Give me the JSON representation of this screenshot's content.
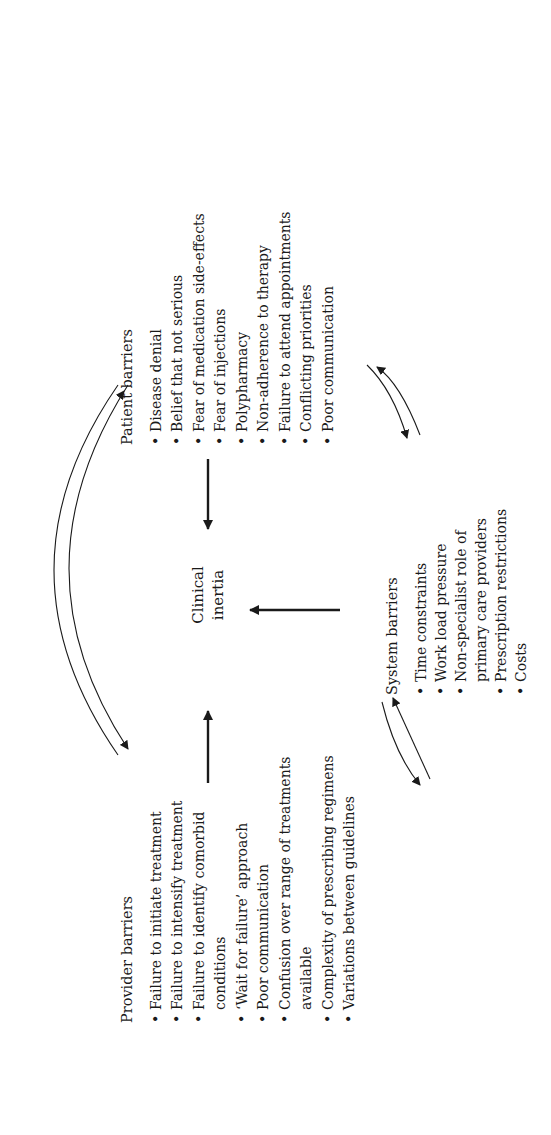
{
  "center": {
    "line1": "Clinical",
    "line2": "inertia"
  },
  "patient_barriers": {
    "title": "Patient barriers",
    "items": [
      "Disease denial",
      "Belief that not serious",
      "Fear of medication side-effects",
      "Fear of injections",
      "Polypharmacy",
      "Non-adherence to therapy",
      "Failure to attend appointments",
      "Conflicting priorities",
      "Poor communication"
    ]
  },
  "provider_barriers": {
    "title": "Provider barriers",
    "items": [
      "Failure to initiate treatment",
      "Failure to intensify treatment",
      "Failure to identify comorbid",
      "conditions",
      "‘Wait for failure’ approach",
      "Poor communication",
      "Confusion over range of treatments",
      "available",
      "Complexity of prescribing regimens",
      "Variations between guidelines"
    ]
  },
  "system_barriers": {
    "title": "System barriers",
    "items": [
      "Time constraints",
      "Work load pressure",
      "Non-specialist role of",
      "primary care providers",
      "Prescription restrictions",
      "Costs"
    ]
  },
  "colors": {
    "ink": "#1a1a1a",
    "background": "#ffffff"
  }
}
